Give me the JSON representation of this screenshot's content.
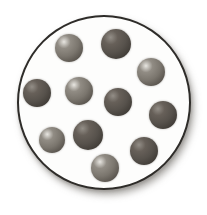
{
  "figure": {
    "background_color": "#ffffff",
    "container": {
      "shape": "circle",
      "x": 17,
      "y": 15,
      "width": 174,
      "height": 175,
      "fill_color": "#fdfdfc",
      "border_color": "#2e2c29",
      "border_width_px": 2,
      "shadow_color": "#6e6a64"
    },
    "particle_styles": {
      "light": {
        "highlight": "#e8e6e1",
        "upper": "#918c84",
        "body": "#7b766e",
        "rim": "#4c4741"
      },
      "dark": {
        "highlight": "#938e87",
        "upper": "#676059",
        "body": "#57524c",
        "rim": "#38342f"
      }
    },
    "particles": [
      {
        "cx": 69,
        "cy": 48,
        "r": 14,
        "shade": "light"
      },
      {
        "cx": 116,
        "cy": 44,
        "r": 15,
        "shade": "dark"
      },
      {
        "cx": 151,
        "cy": 72,
        "r": 14,
        "shade": "light"
      },
      {
        "cx": 37,
        "cy": 93,
        "r": 14,
        "shade": "dark"
      },
      {
        "cx": 79,
        "cy": 91,
        "r": 14,
        "shade": "light"
      },
      {
        "cx": 118,
        "cy": 102,
        "r": 14,
        "shade": "dark"
      },
      {
        "cx": 163,
        "cy": 115,
        "r": 14,
        "shade": "dark"
      },
      {
        "cx": 52,
        "cy": 140,
        "r": 13,
        "shade": "light"
      },
      {
        "cx": 88,
        "cy": 135,
        "r": 15,
        "shade": "dark"
      },
      {
        "cx": 144,
        "cy": 151,
        "r": 14,
        "shade": "dark"
      },
      {
        "cx": 105,
        "cy": 168,
        "r": 14,
        "shade": "light"
      }
    ],
    "counts": {
      "total": 11,
      "light": 5,
      "dark": 6
    }
  }
}
